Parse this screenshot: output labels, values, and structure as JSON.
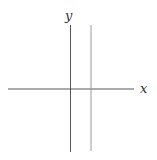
{
  "figure": {
    "type": "coordinate-axes-with-vertical-line",
    "axes": {
      "x_label": "x",
      "y_label": "y"
    },
    "vertical_line": {
      "description": "vertical line to the right of the y-axis",
      "color": "#9a9a9a"
    },
    "axis_color": "#555555"
  }
}
